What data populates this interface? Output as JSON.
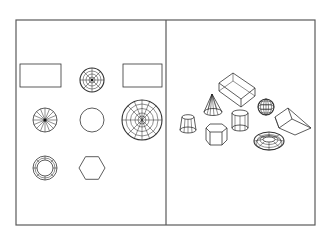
{
  "figure": {
    "colors": {
      "background": "#ffffff",
      "frame": "#5a5a5a",
      "lines": "#333333"
    }
  },
  "viewports": [
    {
      "name": "top-view",
      "objects": [
        {
          "shape": "box",
          "view": "rectangle"
        },
        {
          "shape": "sphere-small",
          "view": "wireframe-circle"
        },
        {
          "shape": "wedge",
          "view": "rectangle"
        },
        {
          "shape": "cone",
          "view": "radial-circle"
        },
        {
          "shape": "cylinder",
          "view": "circle"
        },
        {
          "shape": "dish/dome",
          "view": "wireframe-circle-large"
        },
        {
          "shape": "torus",
          "view": "ring"
        },
        {
          "shape": "hexagonal-prism",
          "view": "hexagon"
        }
      ]
    },
    {
      "name": "isometric-view",
      "objects": [
        {
          "shape": "box"
        },
        {
          "shape": "cone"
        },
        {
          "shape": "truncated-cone"
        },
        {
          "shape": "cylinder"
        },
        {
          "shape": "hexagonal-prism"
        },
        {
          "shape": "sphere"
        },
        {
          "shape": "torus"
        },
        {
          "shape": "wedge"
        }
      ]
    }
  ]
}
